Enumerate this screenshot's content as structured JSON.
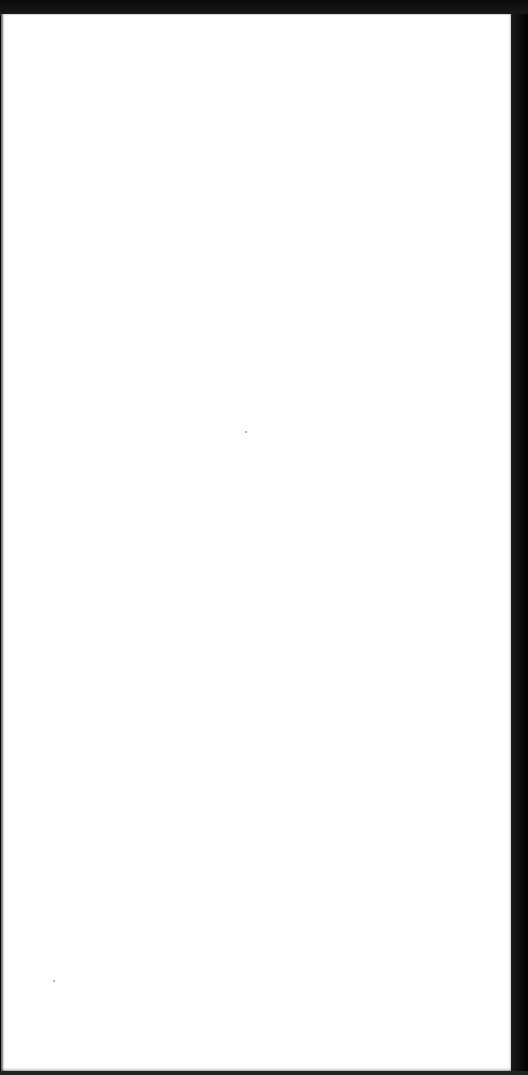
{
  "document": {
    "type": "scanned-blank-page",
    "text": "",
    "colors": {
      "page": "#ffffff",
      "background": "#000000"
    }
  }
}
